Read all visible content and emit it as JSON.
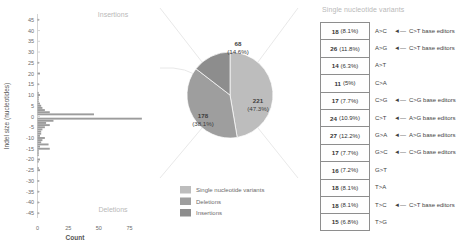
{
  "chart_data": [
    {
      "type": "bar",
      "id": "indel-size-histogram",
      "orientation": "horizontal",
      "title": "",
      "xlabel": "Count",
      "ylabel": "Indel size (nucleotides)",
      "xlim": [
        0,
        90
      ],
      "ylim": [
        -47,
        47
      ],
      "xticks": [
        0,
        25,
        50,
        75
      ],
      "yticks": [
        45,
        40,
        35,
        30,
        25,
        20,
        15,
        10,
        5,
        0,
        -5,
        -10,
        -15,
        -20,
        -25,
        -30,
        -35,
        -40,
        -45
      ],
      "annotations": [
        "Insertions",
        "Deletions"
      ],
      "grid": false,
      "bar_color": "#9c9c9c",
      "categories": [
        45,
        44,
        43,
        42,
        41,
        40,
        39,
        38,
        37,
        36,
        35,
        34,
        33,
        32,
        31,
        30,
        29,
        28,
        27,
        26,
        25,
        24,
        23,
        22,
        21,
        20,
        19,
        18,
        17,
        16,
        15,
        14,
        13,
        12,
        11,
        10,
        9,
        8,
        7,
        6,
        5,
        4,
        3,
        2,
        1,
        0,
        -1,
        -2,
        -3,
        -4,
        -5,
        -6,
        -7,
        -8,
        -9,
        -10,
        -11,
        -12,
        -13,
        -14,
        -15,
        -16,
        -17,
        -18,
        -19,
        -20,
        -21,
        -22,
        -23,
        -24,
        -25,
        -26,
        -27,
        -28,
        -29,
        -30,
        -31,
        -32,
        -33,
        -34,
        -35,
        -36,
        -37,
        -38,
        -39,
        -40,
        -41,
        -42,
        -43,
        -44,
        -45
      ],
      "values": [
        1,
        0,
        0,
        0,
        0,
        0,
        0,
        0,
        0,
        0,
        0,
        0,
        0,
        0,
        0,
        0,
        0,
        0,
        0,
        0,
        1,
        0,
        0,
        0,
        0,
        2,
        0,
        0,
        0,
        0,
        1,
        0,
        0,
        0,
        1,
        2,
        1,
        1,
        1,
        2,
        3,
        4,
        6,
        10,
        46,
        0,
        85,
        13,
        7,
        10,
        6,
        4,
        3,
        3,
        2,
        6,
        4,
        3,
        9,
        2,
        10,
        1,
        1,
        1,
        0,
        2,
        1,
        0,
        0,
        1,
        2,
        0,
        0,
        0,
        0,
        1,
        0,
        0,
        0,
        0,
        1,
        0,
        0,
        0,
        0,
        1,
        0,
        0,
        0,
        0,
        1
      ]
    },
    {
      "type": "pie",
      "id": "edit-outcome-pie",
      "title": "",
      "labels": [
        "Single nucleotide variants",
        "Deletions",
        "Insertions"
      ],
      "values": [
        221,
        178,
        68
      ],
      "percents": [
        "47.3%",
        "38.1%",
        "14.6%"
      ],
      "value_labels": [
        "221",
        "178",
        "68"
      ],
      "pct_labels": [
        "(47.3%)",
        "(38.1%)",
        "(14.6%)"
      ],
      "colors": [
        "#bdbdbd",
        "#9e9e9e",
        "#8d8d8d"
      ],
      "legend_position": "bottom"
    },
    {
      "type": "table",
      "id": "single-nucleotide-variants-table",
      "title": "Single nucleotide variants",
      "columns": [
        "count",
        "substitution",
        "base_editor_annotation"
      ],
      "rows": [
        {
          "count": "18",
          "percent": "(8.1%)",
          "substitution": "A>C",
          "annotation": "C>T base editors",
          "has_arrow": true
        },
        {
          "count": "26",
          "percent": "(11.8%)",
          "substitution": "A>G",
          "annotation": "C>T base editors",
          "has_arrow": true
        },
        {
          "count": "14",
          "percent": "(6.3%)",
          "substitution": "A>T",
          "annotation": "",
          "has_arrow": false
        },
        {
          "count": "11",
          "percent": "(5%)",
          "substitution": "C>A",
          "annotation": "",
          "has_arrow": false
        },
        {
          "count": "17",
          "percent": "(7.7%)",
          "substitution": "C>G",
          "annotation": "C>G base editors",
          "has_arrow": true
        },
        {
          "count": "24",
          "percent": "(10.9%)",
          "substitution": "C>T",
          "annotation": "A>G base editors",
          "has_arrow": true
        },
        {
          "count": "27",
          "percent": "(12.2%)",
          "substitution": "G>A",
          "annotation": "A>G base editors",
          "has_arrow": true
        },
        {
          "count": "17",
          "percent": "(7.7%)",
          "substitution": "G>C",
          "annotation": "C>G base editors",
          "has_arrow": true
        },
        {
          "count": "16",
          "percent": "(7.2%)",
          "substitution": "G>T",
          "annotation": "",
          "has_arrow": false
        },
        {
          "count": "18",
          "percent": "(8.1%)",
          "substitution": "T>A",
          "annotation": "",
          "has_arrow": false
        },
        {
          "count": "18",
          "percent": "(8.1%)",
          "substitution": "T>C",
          "annotation": "C>T base editors",
          "has_arrow": true
        },
        {
          "count": "15",
          "percent": "(6.8%)",
          "substitution": "T>G",
          "annotation": "",
          "has_arrow": false
        }
      ]
    }
  ],
  "indel_panel": {
    "ylabel": "Indel size (nucleotides)",
    "xlabel": "Count",
    "insertions_label": "Insertions",
    "deletions_label": "Deletions"
  },
  "pie_panel": {
    "legend": [
      {
        "label": "Single nucleotide variants",
        "color": "#bdbdbd"
      },
      {
        "label": "Deletions",
        "color": "#9e9e9e"
      },
      {
        "label": "Insertions",
        "color": "#8d8d8d"
      }
    ],
    "slices": [
      {
        "value": "221",
        "pct": "(47.3%)"
      },
      {
        "value": "178",
        "pct": "(38.1%)"
      },
      {
        "value": "68",
        "pct": "(14.6%)"
      }
    ]
  },
  "snv_panel": {
    "title": "Single nucleotide variants",
    "arrow_glyph": "◄—"
  },
  "colors": {
    "bar": "#9c9c9c",
    "axis": "#b5b5b5",
    "text": "#4a4a4a",
    "muted": "#b9b9b9",
    "pie_snv": "#bdbdbd",
    "pie_del": "#9e9e9e",
    "pie_ins": "#8d8d8d"
  }
}
